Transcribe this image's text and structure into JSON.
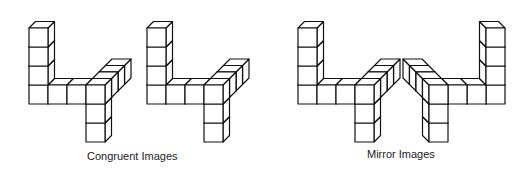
{
  "captions": {
    "congruent": "Congruent Images",
    "mirror": "Mirror Images"
  },
  "style": {
    "stroke": "#111111",
    "fill": "#ffffff",
    "text": "#222222"
  },
  "projection": {
    "unit": 19,
    "depth_dx": 6.5,
    "depth_dy": -6.5
  },
  "figures": [
    {
      "name": "congruent-figure-1",
      "group": "congruent",
      "origin": [
        29,
        104
      ],
      "mirror": false,
      "cubes": [
        [
          0,
          0,
          0
        ],
        [
          0,
          1,
          0
        ],
        [
          0,
          2,
          0
        ],
        [
          0,
          3,
          0
        ],
        [
          1,
          0,
          0
        ],
        [
          2,
          0,
          0
        ],
        [
          3,
          0,
          0
        ],
        [
          3,
          0,
          1
        ],
        [
          3,
          0,
          2
        ],
        [
          3,
          0,
          3
        ],
        [
          3,
          -1,
          0
        ],
        [
          3,
          -2,
          0
        ]
      ]
    },
    {
      "name": "congruent-figure-2",
      "group": "congruent",
      "origin": [
        147,
        104
      ],
      "mirror": false,
      "cubes": [
        [
          0,
          0,
          0
        ],
        [
          0,
          1,
          0
        ],
        [
          0,
          2,
          0
        ],
        [
          0,
          3,
          0
        ],
        [
          1,
          0,
          0
        ],
        [
          2,
          0,
          0
        ],
        [
          3,
          0,
          0
        ],
        [
          3,
          0,
          1
        ],
        [
          3,
          0,
          2
        ],
        [
          3,
          0,
          3
        ],
        [
          3,
          -1,
          0
        ],
        [
          3,
          -2,
          0
        ]
      ]
    },
    {
      "name": "mirror-figure-1",
      "group": "mirror",
      "origin": [
        298,
        104
      ],
      "mirror": false,
      "cubes": [
        [
          0,
          0,
          0
        ],
        [
          0,
          1,
          0
        ],
        [
          0,
          2,
          0
        ],
        [
          0,
          3,
          0
        ],
        [
          1,
          0,
          0
        ],
        [
          2,
          0,
          0
        ],
        [
          3,
          0,
          0
        ],
        [
          3,
          0,
          1
        ],
        [
          3,
          0,
          2
        ],
        [
          3,
          0,
          3
        ],
        [
          3,
          -1,
          0
        ],
        [
          3,
          -2,
          0
        ]
      ]
    },
    {
      "name": "mirror-figure-2",
      "group": "mirror",
      "origin": [
        505,
        104
      ],
      "mirror": true,
      "cubes": [
        [
          0,
          0,
          0
        ],
        [
          0,
          1,
          0
        ],
        [
          0,
          2,
          0
        ],
        [
          0,
          3,
          0
        ],
        [
          1,
          0,
          0
        ],
        [
          2,
          0,
          0
        ],
        [
          3,
          0,
          0
        ],
        [
          3,
          0,
          1
        ],
        [
          3,
          0,
          2
        ],
        [
          3,
          0,
          3
        ],
        [
          3,
          -1,
          0
        ],
        [
          3,
          -2,
          0
        ]
      ]
    }
  ]
}
